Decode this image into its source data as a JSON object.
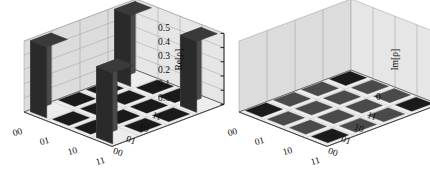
{
  "figure": {
    "kind": "density-matrix-tomography",
    "background": "#ffffff",
    "ink": "#0d0d0d"
  },
  "chart_data": [
    {
      "type": "bar",
      "subtype": "3d-bar-matrix",
      "title": "",
      "zlabel": "Re[ρ]",
      "xlabel": "",
      "ylabel": "",
      "categories_x": [
        "00",
        "01",
        "10",
        "11"
      ],
      "categories_y": [
        "00",
        "01",
        "10",
        "11"
      ],
      "ztick_labels": [
        "0.0",
        "0.1",
        "0.2",
        "0.3",
        "0.4",
        "0.5"
      ],
      "ztick_values": [
        0.0,
        0.1,
        0.2,
        0.3,
        0.4,
        0.5
      ],
      "zlim": [
        0.0,
        0.5
      ],
      "grid": true,
      "legend": "none",
      "matrix": [
        [
          0.5,
          0.02,
          0.02,
          0.5
        ],
        [
          0.02,
          0.02,
          0.02,
          0.02
        ],
        [
          0.02,
          0.02,
          0.02,
          0.02
        ],
        [
          0.5,
          0.02,
          0.02,
          0.5
        ]
      ]
    },
    {
      "type": "bar",
      "subtype": "3d-bar-matrix",
      "title": "",
      "zlabel": "Im[ρ]",
      "xlabel": "",
      "ylabel": "",
      "categories_x": [
        "00",
        "01",
        "10",
        "11"
      ],
      "categories_y": [
        "00",
        "01",
        "10",
        "11"
      ],
      "ztick_labels": [
        "0"
      ],
      "ztick_values": [
        0
      ],
      "zlim": [
        0,
        0.5
      ],
      "grid": true,
      "legend": "none",
      "matrix": [
        [
          0.0,
          0.0,
          0.0,
          0.0
        ],
        [
          0.0,
          0.0,
          0.0,
          0.0
        ],
        [
          0.0,
          0.0,
          0.0,
          0.0
        ],
        [
          0.0,
          0.0,
          0.0,
          0.0
        ]
      ]
    }
  ],
  "panels": [
    {
      "name": "real-part",
      "axis_title": "Re[ρ]",
      "z_ticks": [
        "0.5",
        "0.4",
        "0.3",
        "0.2",
        "0.1",
        "0.0"
      ],
      "front_axis_labels": [
        "00",
        "01",
        "10",
        "11"
      ],
      "side_axis_labels": [
        "11",
        "10",
        "01",
        "00"
      ]
    },
    {
      "name": "imaginary-part",
      "axis_title": "Im[ρ]",
      "z_ticks": [
        "0"
      ],
      "front_axis_labels": [
        "00",
        "01",
        "10",
        "11"
      ],
      "side_axis_labels": [
        "11",
        "10",
        "01",
        "00"
      ]
    }
  ],
  "colors": {
    "bar_top": "#3a3a3a",
    "bar_left": "#4a4a4a",
    "bar_right": "#2a2a2a",
    "tile_dark": "#1a1a1a",
    "tile_mid": "#4a4a4a",
    "floor": "#ededed",
    "wall_back": "#e6e6e6",
    "wall_side": "#dcdcdc",
    "gridline": "#9a9a9a",
    "outline": "#3c3c3c"
  }
}
